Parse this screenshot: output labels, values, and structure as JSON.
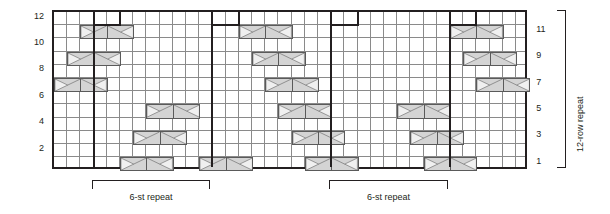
{
  "chart_data": {
    "type": "table",
    "title": "",
    "grid": {
      "columns": 36,
      "rows": 12,
      "cell_width": 13.2,
      "cell_height": 13.2,
      "origin_x": 52,
      "origin_y": 10,
      "grid_line_color": "#8a8a8a",
      "border_color": "#231f20",
      "background": "#ffffff",
      "grid_on": true
    },
    "row_labels_left": [
      "12",
      "10",
      "8",
      "6",
      "4",
      "2"
    ],
    "row_labels_left_rows": [
      12,
      10,
      8,
      6,
      4,
      2
    ],
    "row_labels_right": [
      "11",
      "9",
      "7",
      "5",
      "3",
      "1"
    ],
    "row_labels_right_rows": [
      11,
      9,
      7,
      5,
      3,
      1
    ],
    "symbol": {
      "name": "cable-cross-2x1",
      "width_cells": 2,
      "height_cells": 1,
      "fill": "#d4d4d4",
      "stroke": "#5a5a5a"
    },
    "cables": [
      {
        "row": 11,
        "col": 3,
        "dir": "right"
      },
      {
        "row": 11,
        "col": 5,
        "dir": "left"
      },
      {
        "row": 9,
        "col": 2,
        "dir": "right"
      },
      {
        "row": 9,
        "col": 4,
        "dir": "left"
      },
      {
        "row": 7,
        "col": 1,
        "dir": "right"
      },
      {
        "row": 7,
        "col": 3,
        "dir": "left"
      },
      {
        "row": 11,
        "col": 15,
        "dir": "right"
      },
      {
        "row": 11,
        "col": 17,
        "dir": "left"
      },
      {
        "row": 9,
        "col": 16,
        "dir": "right"
      },
      {
        "row": 9,
        "col": 18,
        "dir": "left"
      },
      {
        "row": 7,
        "col": 17,
        "dir": "right"
      },
      {
        "row": 7,
        "col": 19,
        "dir": "left"
      },
      {
        "row": 5,
        "col": 18,
        "dir": "right"
      },
      {
        "row": 5,
        "col": 20,
        "dir": "left"
      },
      {
        "row": 3,
        "col": 19,
        "dir": "right"
      },
      {
        "row": 3,
        "col": 21,
        "dir": "left"
      },
      {
        "row": 1,
        "col": 20,
        "dir": "right"
      },
      {
        "row": 1,
        "col": 22,
        "dir": "left"
      },
      {
        "row": 5,
        "col": 8,
        "dir": "right"
      },
      {
        "row": 5,
        "col": 10,
        "dir": "left"
      },
      {
        "row": 3,
        "col": 7,
        "dir": "right"
      },
      {
        "row": 3,
        "col": 9,
        "dir": "left"
      },
      {
        "row": 1,
        "col": 6,
        "dir": "right"
      },
      {
        "row": 1,
        "col": 8,
        "dir": "left"
      },
      {
        "row": 5,
        "col": 27,
        "dir": "right"
      },
      {
        "row": 5,
        "col": 29,
        "dir": "left"
      },
      {
        "row": 3,
        "col": 28,
        "dir": "right"
      },
      {
        "row": 3,
        "col": 30,
        "dir": "left"
      },
      {
        "row": 1,
        "col": 29,
        "dir": "right"
      },
      {
        "row": 1,
        "col": 31,
        "dir": "left"
      },
      {
        "row": 11,
        "col": 31,
        "dir": "right"
      },
      {
        "row": 11,
        "col": 33,
        "dir": "left"
      },
      {
        "row": 9,
        "col": 32,
        "dir": "right"
      },
      {
        "row": 9,
        "col": 34,
        "dir": "left"
      },
      {
        "row": 7,
        "col": 33,
        "dir": "right"
      },
      {
        "row": 7,
        "col": 35,
        "dir": "left"
      },
      {
        "row": 1,
        "col": 12,
        "dir": "right"
      },
      {
        "row": 1,
        "col": 14,
        "dir": "left"
      }
    ],
    "repeat_lines_cols": [
      4,
      13,
      22,
      31
    ],
    "steps": [
      {
        "col": 4,
        "row": 11
      },
      {
        "col": 13,
        "row": 11
      },
      {
        "col": 22,
        "row": 11
      },
      {
        "col": 31,
        "row": 11
      }
    ]
  },
  "brackets": {
    "st_repeat_1": {
      "label": "6-st repeat",
      "start_col": 4,
      "end_col": 13
    },
    "st_repeat_2": {
      "label": "6-st repeat",
      "start_col": 22,
      "end_col": 31
    },
    "row_repeat": {
      "label": "12-row repeat",
      "start_row": 1,
      "end_row": 12
    }
  }
}
